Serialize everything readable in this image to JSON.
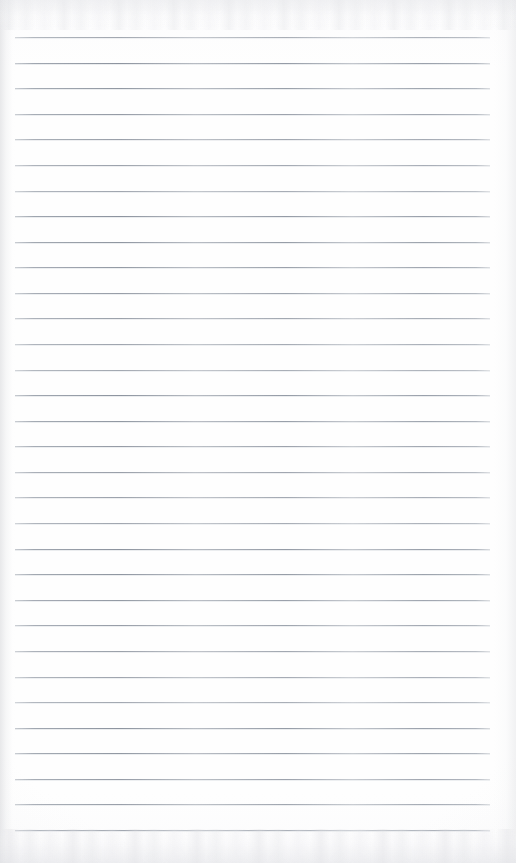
{
  "document": {
    "kind": "scanned-image",
    "subject": "blank ruled notepad page",
    "title": "Scanned Ruled Notepad Page",
    "width": 516,
    "height": 863,
    "text_content": "",
    "handwriting_present": "no",
    "printed_text_present": "no"
  },
  "paper": {
    "background_color": "#fdfdfd",
    "surface_tone": "warm white",
    "left_edge_shadow_color": "#d6d7da",
    "right_edge_shadow_color": "#dedfe2",
    "scan_band_color": "#e6e7ea",
    "scan_band_top_height": 30,
    "scan_band_bottom_height": 34
  },
  "ruling": {
    "style": "horizontal ruled lines",
    "line_color": "#9aa1ab",
    "line_halo_color": "#c4c9d1",
    "line_thickness": 1,
    "line_count": 32,
    "first_line_y": 37,
    "line_spacing": 25.58,
    "line_start_x": 15,
    "line_end_x": 490,
    "line_length": 475,
    "margin_rule_present": "no",
    "line_y_positions": [
      37,
      62.6,
      88.2,
      113.7,
      139.3,
      164.9,
      190.5,
      216.1,
      241.6,
      267.2,
      292.8,
      318.4,
      344.0,
      369.5,
      395.1,
      420.7,
      446.3,
      471.9,
      497.4,
      523.0,
      548.6,
      574.2,
      599.8,
      625.3,
      650.9,
      676.5,
      702.1,
      727.7,
      753.2,
      778.8,
      804.4,
      830.0
    ]
  }
}
